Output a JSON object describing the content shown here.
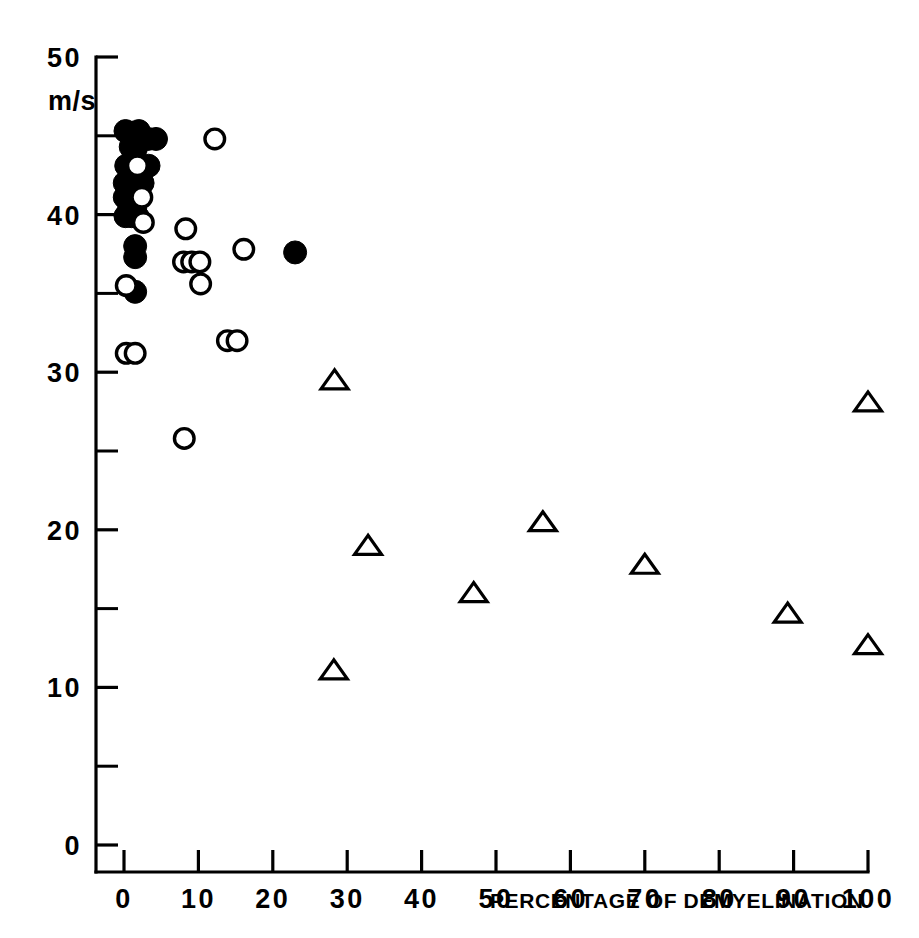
{
  "chart_data": {
    "type": "scatter",
    "title": "",
    "xlabel": "PERCENTAGE OF DEMYELINATION",
    "ylabel": "m/s",
    "ylabel_unit": "m/s",
    "xlim": [
      0,
      100
    ],
    "ylim": [
      0,
      50
    ],
    "grid": false,
    "legend": "none",
    "x_ticks": [
      0,
      10,
      20,
      30,
      40,
      50,
      60,
      70,
      80,
      90,
      100
    ],
    "x_tick_labels": [
      "0",
      "10",
      "20",
      "30",
      "40",
      "50",
      "60",
      "70",
      "80",
      "90",
      "100"
    ],
    "y_ticks": [
      0,
      10,
      20,
      30,
      40,
      50
    ],
    "y_tick_labels": [
      "0",
      "10",
      "20",
      "30",
      "40",
      "50"
    ],
    "y_minor_ticks": [
      5,
      15,
      25,
      35,
      45
    ],
    "marker_colors": {
      "filled_circle": "#000000",
      "open_circle_stroke": "#000000",
      "open_circle_fill": "#ffffff",
      "triangle_stroke": "#000000",
      "triangle_fill": "#ffffff",
      "axis": "#000000",
      "background": "#ffffff"
    },
    "series": [
      {
        "name": "filled-circle",
        "marker": "filled-circle",
        "points": [
          [
            0.2,
            45.3
          ],
          [
            1.1,
            45.2
          ],
          [
            1.7,
            44.9
          ],
          [
            2.0,
            45.3
          ],
          [
            0.9,
            44.3
          ],
          [
            1.6,
            44.2
          ],
          [
            3.2,
            44.8
          ],
          [
            4.3,
            44.8
          ],
          [
            0.3,
            43.1
          ],
          [
            3.3,
            43.1
          ],
          [
            0.1,
            42.0
          ],
          [
            0.9,
            42.0
          ],
          [
            1.7,
            42.0
          ],
          [
            2.5,
            42.0
          ],
          [
            0.1,
            41.1
          ],
          [
            0.8,
            41.1
          ],
          [
            1.5,
            41.1
          ],
          [
            0.7,
            40.4
          ],
          [
            1.5,
            40.4
          ],
          [
            0.2,
            39.9
          ],
          [
            1.0,
            39.9
          ],
          [
            1.8,
            39.9
          ],
          [
            1.5,
            38.0
          ],
          [
            1.5,
            37.3
          ],
          [
            1.5,
            35.1
          ],
          [
            23.0,
            37.6
          ]
        ]
      },
      {
        "name": "open-circle",
        "marker": "open-circle",
        "points": [
          [
            1.8,
            43.1
          ],
          [
            2.4,
            41.1
          ],
          [
            2.6,
            39.5
          ],
          [
            12.2,
            44.8
          ],
          [
            8.3,
            39.1
          ],
          [
            8.0,
            37.0
          ],
          [
            9.1,
            37.0
          ],
          [
            10.2,
            37.0
          ],
          [
            16.1,
            37.8
          ],
          [
            10.3,
            35.6
          ],
          [
            13.9,
            32.0
          ],
          [
            15.2,
            32.0
          ],
          [
            0.3,
            35.5
          ],
          [
            0.3,
            31.2
          ],
          [
            1.5,
            31.2
          ],
          [
            8.1,
            25.8
          ]
        ]
      },
      {
        "name": "open-triangle",
        "marker": "open-triangle",
        "points": [
          [
            28.3,
            29.5
          ],
          [
            100.0,
            28.1
          ],
          [
            32.8,
            19.0
          ],
          [
            56.3,
            20.5
          ],
          [
            70.0,
            17.8
          ],
          [
            47.0,
            16.0
          ],
          [
            89.2,
            14.7
          ],
          [
            100.0,
            12.7
          ],
          [
            28.2,
            11.1
          ]
        ]
      }
    ]
  }
}
